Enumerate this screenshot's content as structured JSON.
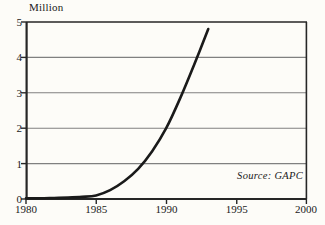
{
  "chart_data": {
    "type": "line",
    "title": "",
    "subtitle": "",
    "ylabel": "Million",
    "xlabel": "",
    "xlim": [
      1980,
      2000
    ],
    "ylim": [
      0,
      5
    ],
    "grid": "horizontal",
    "legend": "none",
    "yticks": [
      "0",
      "1",
      "2",
      "3",
      "4",
      "5"
    ],
    "ytick_values": [
      0,
      1,
      2,
      3,
      4,
      5
    ],
    "xticks": [
      "1980",
      "1985",
      "1990",
      "1995",
      "2000"
    ],
    "xtick_values": [
      1980,
      1985,
      1990,
      1995,
      2000
    ],
    "annotations": [
      {
        "name": "source-note",
        "text": "Source: GAPC",
        "style": "italic",
        "position": "bottom-right"
      }
    ],
    "series": [
      {
        "name": "Million",
        "color": "#1a1a1a",
        "x": [
          1980,
          1981,
          1982,
          1983,
          1984,
          1985,
          1986,
          1987,
          1988,
          1989,
          1990,
          1991,
          1992,
          1993
        ],
        "values": [
          0.02,
          0.02,
          0.03,
          0.04,
          0.06,
          0.1,
          0.25,
          0.5,
          0.85,
          1.35,
          2.0,
          2.85,
          3.8,
          4.8
        ]
      }
    ]
  },
  "colors": {
    "background": "#fdfcf8",
    "axis": "#262626",
    "gridline": "#808080",
    "curve": "#1a1a1a",
    "text": "#1a1a1a"
  }
}
